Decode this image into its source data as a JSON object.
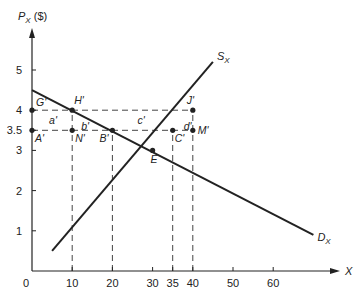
{
  "chart_data": {
    "type": "line",
    "title": "",
    "xlabel": "X",
    "ylabel": "P_X ($)",
    "xlim": [
      0,
      75
    ],
    "ylim": [
      0,
      5.8
    ],
    "x_ticks": [
      0,
      10,
      20,
      30,
      35,
      40,
      50,
      60
    ],
    "y_ticks": [
      1,
      2,
      3,
      3.5,
      4,
      5
    ],
    "x_tick_labels": [
      "0",
      "10",
      "20",
      "30",
      "35",
      "40",
      "50",
      "60"
    ],
    "y_tick_labels": [
      "1",
      "2",
      "3",
      "3.5",
      "4",
      "5"
    ],
    "grid": false,
    "series": [
      {
        "name": "D_X",
        "label_main": "D",
        "label_sub": "X",
        "points": [
          [
            0,
            4.5
          ],
          [
            70,
            0.9
          ]
        ]
      },
      {
        "name": "S_X",
        "label_main": "S",
        "label_sub": "X",
        "points": [
          [
            5,
            0.5
          ],
          [
            45,
            5.2
          ]
        ]
      }
    ],
    "points": [
      {
        "label": "G'",
        "x": 0,
        "y": 4
      },
      {
        "label": "H'",
        "x": 10,
        "y": 4
      },
      {
        "label": "J'",
        "x": 40,
        "y": 4
      },
      {
        "label": "A'",
        "x": 0,
        "y": 3.5
      },
      {
        "label": "N'",
        "x": 10,
        "y": 3.5
      },
      {
        "label": "B'",
        "x": 20,
        "y": 3.5
      },
      {
        "label": "C'",
        "x": 35,
        "y": 3.5
      },
      {
        "label": "M'",
        "x": 40,
        "y": 3.5
      },
      {
        "label": "E",
        "x": 30,
        "y": 3
      }
    ],
    "area_labels": [
      {
        "label": "a'",
        "x": 5,
        "y": 3.75
      },
      {
        "label": "b'",
        "x": 13,
        "y": 3.6
      },
      {
        "label": "c'",
        "x": 27,
        "y": 3.75
      },
      {
        "label": "d'",
        "x": 38.5,
        "y": 3.6
      }
    ],
    "dashed_horizontal": [
      {
        "y": 4,
        "x_from": 0,
        "x_to": 40
      },
      {
        "y": 3.5,
        "x_from": 0,
        "x_to": 40
      }
    ],
    "dashed_vertical": [
      {
        "x": 10,
        "y_from": 0,
        "y_to": 4
      },
      {
        "x": 20,
        "y_from": 0,
        "y_to": 3.5
      },
      {
        "x": 35,
        "y_from": 0,
        "y_to": 3.5
      },
      {
        "x": 40,
        "y_from": 0,
        "y_to": 4
      }
    ],
    "colors": {
      "line": "#222222",
      "dash": "#444444",
      "background": "#ffffff"
    }
  }
}
